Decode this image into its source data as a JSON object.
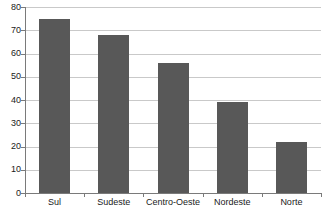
{
  "chart_data": {
    "type": "bar",
    "title": "",
    "subtitle": "",
    "xlabel": "",
    "ylabel": "",
    "categories": [
      "Sul",
      "Sudeste",
      "Centro-Oeste",
      "Nordeste",
      "Norte"
    ],
    "values": [
      75,
      68,
      56,
      39,
      22
    ],
    "series": [
      {
        "name": "",
        "values": [
          75,
          68,
          56,
          39,
          22
        ]
      }
    ],
    "ylim": [
      0,
      80
    ],
    "y_ticks": [
      0,
      10,
      20,
      30,
      40,
      50,
      60,
      70,
      80
    ],
    "y_tick_labels": [
      "0",
      "10",
      "20",
      "30",
      "40",
      "50",
      "60",
      "70",
      "80"
    ],
    "grid": true,
    "grid_axis": "y",
    "legend": false,
    "legend_position": "none",
    "annotations": [],
    "colors": {
      "bar": "#585858",
      "grid": "#c9c9c9",
      "axis": "#7a7a7a",
      "text": "#1a1a1a",
      "background": "#ffffff"
    }
  }
}
